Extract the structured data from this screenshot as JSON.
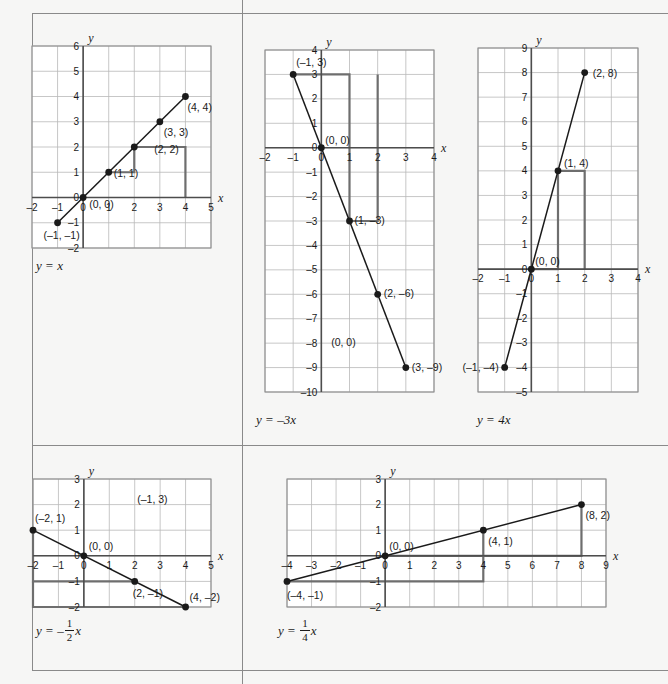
{
  "page": {
    "background_color": "#f6f6f5",
    "border_color": "#8a8a8a",
    "grid_color": "#b9b9b9",
    "axis_color": "#4d4d4d",
    "curve_color": "#1a1a1a",
    "helper_color": "#6e6e6e"
  },
  "chart_data": [
    {
      "id": "chart-y-equals-x",
      "type": "line",
      "title": "y = x",
      "equation_parts": {
        "lhs": "y",
        "op": "=",
        "rhs": "x"
      },
      "xlabel": "x",
      "ylabel": "y",
      "xlim": [
        -2,
        5
      ],
      "ylim": [
        -2,
        6
      ],
      "xticks": [
        -2,
        -1,
        0,
        1,
        2,
        3,
        4,
        5
      ],
      "xtick_labels": [
        "–2",
        "–1",
        "0",
        "1",
        "2",
        "3",
        "4",
        "5"
      ],
      "yticks": [
        -2,
        -1,
        0,
        1,
        2,
        3,
        4,
        5,
        6
      ],
      "ytick_labels": [
        "–2",
        "–1",
        "0",
        "1",
        "2",
        "3",
        "4",
        "5",
        "6"
      ],
      "grid": true,
      "legend": null,
      "points": [
        {
          "x": -1,
          "y": -1,
          "label": "(–1, –1)",
          "label_dx": 4,
          "label_dy": 16,
          "anchor": "middle"
        },
        {
          "x": 0,
          "y": 0,
          "label": "(0, 0)",
          "label_dx": 6,
          "label_dy": 10,
          "anchor": "start"
        },
        {
          "x": 1,
          "y": 1,
          "label": "(1, 1)",
          "label_dx": 5,
          "label_dy": 5,
          "anchor": "start"
        },
        {
          "x": 2,
          "y": 2,
          "label": "(2, 2)",
          "label_dx": 20,
          "label_dy": 6,
          "anchor": "start"
        },
        {
          "x": 3,
          "y": 3,
          "label": "(3, 3)",
          "label_dx": 4,
          "label_dy": 14,
          "anchor": "start"
        },
        {
          "x": 4,
          "y": 4,
          "label": "(4, 4)",
          "label_dx": 2,
          "label_dy": 14,
          "anchor": "start"
        }
      ],
      "line_from": {
        "x": -1.05,
        "y": -1.05
      },
      "line_to": {
        "x": 4,
        "y": 4
      },
      "rise_run_steps": [
        {
          "from": {
            "x": 1,
            "y": 1
          },
          "corner": {
            "x": 2,
            "y": 1
          },
          "to": {
            "x": 2,
            "y": 2
          }
        },
        {
          "from": {
            "x": 2,
            "y": 2
          },
          "corner": {
            "x": 4,
            "y": 2
          },
          "to": {
            "x": 4,
            "y": 0
          }
        }
      ]
    },
    {
      "id": "chart-y-equals-minus-3x",
      "type": "line",
      "title": "y = –3x",
      "equation_parts": {
        "lhs": "y",
        "op": "=",
        "rhs": "–3x"
      },
      "xlabel": "x",
      "ylabel": "y",
      "xlim": [
        -2,
        4
      ],
      "ylim": [
        -10,
        4
      ],
      "xticks": [
        -2,
        -1,
        0,
        1,
        2,
        3,
        4
      ],
      "xtick_labels": [
        "–2",
        "–1",
        "0",
        "1",
        "2",
        "3",
        "4"
      ],
      "yticks": [
        -10,
        -9,
        -8,
        -7,
        -6,
        -5,
        -4,
        -3,
        -2,
        -1,
        0,
        1,
        2,
        3,
        4
      ],
      "ytick_labels": [
        "–10",
        "–9",
        "–8",
        "–7",
        "–6",
        "–5",
        "–4",
        "–3",
        "–2",
        "–1",
        "0",
        "1",
        "2",
        "3",
        "4"
      ],
      "grid": true,
      "legend": null,
      "points": [
        {
          "x": -1,
          "y": 3,
          "label": "(–1, 3)",
          "label_dx": 3,
          "label_dy": -8,
          "anchor": "start"
        },
        {
          "x": 0,
          "y": 0,
          "label": "(0, 0)",
          "label_dx": 4,
          "label_dy": -4,
          "anchor": "start"
        },
        {
          "x": 1,
          "y": -3,
          "label": "(1, –3)",
          "label_dx": 5,
          "label_dy": 3,
          "anchor": "start"
        },
        {
          "x": 2,
          "y": -6,
          "label": "(2, –6)",
          "label_dx": 6,
          "label_dy": 3,
          "anchor": "start"
        },
        {
          "x": 3,
          "y": -9,
          "label": "(3, –9)",
          "label_dx": 6,
          "label_dy": 3,
          "anchor": "start"
        }
      ],
      "extra_labels": [
        {
          "x": 0.35,
          "y": -8.1,
          "text": "(0, 0)",
          "anchor": "start"
        }
      ],
      "line_from": {
        "x": -1,
        "y": 3
      },
      "line_to": {
        "x": 3,
        "y": -9
      },
      "rise_run_steps": [
        {
          "from": {
            "x": -1,
            "y": 3
          },
          "corner": {
            "x": 1,
            "y": 3
          },
          "to": {
            "x": 1,
            "y": -3
          }
        },
        {
          "from": {
            "x": 1,
            "y": -3
          },
          "corner": {
            "x": 2,
            "y": -3
          },
          "to": {
            "x": 2,
            "y": 3
          }
        }
      ]
    },
    {
      "id": "chart-y-equals-4x",
      "type": "line",
      "title": "y = 4x",
      "equation_parts": {
        "lhs": "y",
        "op": "=",
        "rhs": "4x"
      },
      "xlabel": "x",
      "ylabel": "y",
      "xlim": [
        -2,
        4
      ],
      "ylim": [
        -5,
        9
      ],
      "xticks": [
        -2,
        -1,
        0,
        1,
        2,
        3,
        4
      ],
      "xtick_labels": [
        "–2",
        "–1",
        "0",
        "1",
        "2",
        "3",
        "4"
      ],
      "yticks": [
        -5,
        -4,
        -3,
        -2,
        -1,
        0,
        1,
        2,
        3,
        4,
        5,
        6,
        7,
        8,
        9
      ],
      "ytick_labels": [
        "–5",
        "–4",
        "–3",
        "–2",
        "–1",
        "0",
        "1",
        "2",
        "3",
        "4",
        "5",
        "6",
        "7",
        "8",
        "9"
      ],
      "grid": true,
      "legend": null,
      "points": [
        {
          "x": -1,
          "y": -4,
          "label": "(–1, –4)",
          "label_dx": -6,
          "label_dy": 4,
          "anchor": "end"
        },
        {
          "x": 0,
          "y": 0,
          "label": "(0, 0)",
          "label_dx": 4,
          "label_dy": -4,
          "anchor": "start"
        },
        {
          "x": 1,
          "y": 4,
          "label": "(1, 4)",
          "label_dx": 6,
          "label_dy": -4,
          "anchor": "start"
        },
        {
          "x": 2,
          "y": 8,
          "label": "(2, 8)",
          "label_dx": 8,
          "label_dy": 4,
          "anchor": "start"
        }
      ],
      "line_from": {
        "x": -1,
        "y": -4
      },
      "line_to": {
        "x": 2,
        "y": 8
      },
      "rise_run_steps": [
        {
          "from": {
            "x": 0,
            "y": 0
          },
          "corner": {
            "x": 1,
            "y": 0
          },
          "to": {
            "x": 1,
            "y": 4
          }
        },
        {
          "from": {
            "x": 1,
            "y": 4
          },
          "corner": {
            "x": 2,
            "y": 4
          },
          "to": {
            "x": 2,
            "y": 0
          }
        }
      ]
    },
    {
      "id": "chart-y-equals-minus-half-x",
      "type": "line",
      "title": "y = –(1/2)x",
      "equation_parts": {
        "lhs": "y",
        "op": "=",
        "sign": "–",
        "num": "1",
        "den": "2",
        "var": "x"
      },
      "xlabel": "x",
      "ylabel": "y",
      "xlim": [
        -2,
        5
      ],
      "ylim": [
        -2,
        3
      ],
      "xticks": [
        -2,
        -1,
        0,
        1,
        2,
        3,
        4,
        5
      ],
      "xtick_labels": [
        "–2",
        "–1",
        "0",
        "1",
        "2",
        "3",
        "4",
        "5"
      ],
      "yticks": [
        -2,
        -1,
        0,
        1,
        2,
        3
      ],
      "ytick_labels": [
        "–2",
        "–1",
        "0",
        "1",
        "2",
        "3"
      ],
      "grid": true,
      "legend": null,
      "points": [
        {
          "x": -2,
          "y": 1,
          "label": "(–2, 1)",
          "label_dx": 2,
          "label_dy": -8,
          "anchor": "start"
        },
        {
          "x": 0,
          "y": 0,
          "label": "(0, 0)",
          "label_dx": 5,
          "label_dy": -6,
          "anchor": "start"
        },
        {
          "x": 2,
          "y": -1,
          "label": "(2, –1)",
          "label_dx": -2,
          "label_dy": 16,
          "anchor": "start"
        },
        {
          "x": 4,
          "y": -2,
          "label": "(4, –2)",
          "label_dx": 4,
          "label_dy": -6,
          "anchor": "start"
        }
      ],
      "extra_labels": [
        {
          "x": 2.1,
          "y": 2.05,
          "text": "(–1, 3)",
          "anchor": "start"
        }
      ],
      "line_from": {
        "x": -2,
        "y": 1
      },
      "line_to": {
        "x": 4,
        "y": -2
      },
      "rise_run_steps": [
        {
          "from": {
            "x": -2,
            "y": 1
          },
          "corner": {
            "x": -2,
            "y": -1
          },
          "to": {
            "x": 2,
            "y": -1
          }
        },
        {
          "from": {
            "x": -2,
            "y": -1
          },
          "corner": {
            "x": -2,
            "y": -2
          },
          "to": {
            "x": 4,
            "y": -2
          }
        }
      ]
    },
    {
      "id": "chart-y-equals-quarter-x",
      "type": "line",
      "title": "y = (1/4)x",
      "equation_parts": {
        "lhs": "y",
        "op": "=",
        "sign": "",
        "num": "1",
        "den": "4",
        "var": "x"
      },
      "xlabel": "x",
      "ylabel": "y",
      "xlim": [
        -4,
        9
      ],
      "ylim": [
        -2,
        3
      ],
      "xticks": [
        -4,
        -3,
        -2,
        -1,
        0,
        1,
        2,
        3,
        4,
        5,
        6,
        7,
        8,
        9
      ],
      "xtick_labels": [
        "–4",
        "–3",
        "–2",
        "–1",
        "0",
        "1",
        "2",
        "3",
        "4",
        "5",
        "6",
        "7",
        "8",
        "9"
      ],
      "yticks": [
        -2,
        -1,
        0,
        1,
        2,
        3
      ],
      "ytick_labels": [
        "–2",
        "–1",
        "0",
        "1",
        "2",
        "3"
      ],
      "grid": true,
      "legend": null,
      "points": [
        {
          "x": -4,
          "y": -1,
          "label": "(–4, –1)",
          "label_dx": 0,
          "label_dy": 18,
          "anchor": "start"
        },
        {
          "x": 0,
          "y": 0,
          "label": "(0, 0)",
          "label_dx": 4,
          "label_dy": -6,
          "anchor": "start"
        },
        {
          "x": 4,
          "y": 1,
          "label": "(4, 1)",
          "label_dx": 5,
          "label_dy": 15,
          "anchor": "start"
        },
        {
          "x": 8,
          "y": 2,
          "label": "(8, 2)",
          "label_dx": 4,
          "label_dy": 14,
          "anchor": "start"
        }
      ],
      "line_from": {
        "x": -4,
        "y": -1
      },
      "line_to": {
        "x": 8,
        "y": 2
      },
      "rise_run_steps": [
        {
          "from": {
            "x": -4,
            "y": -1
          },
          "corner": {
            "x": 4,
            "y": -1
          },
          "to": {
            "x": 4,
            "y": 1
          }
        },
        {
          "from": {
            "x": 0,
            "y": 0
          },
          "corner": {
            "x": 8,
            "y": 0
          },
          "to": {
            "x": 8,
            "y": 2
          }
        }
      ]
    }
  ]
}
